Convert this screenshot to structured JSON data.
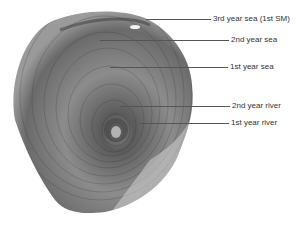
{
  "figure": {
    "labels": [
      {
        "text": "3rd year sea (1st SM)",
        "y": 19,
        "line_x1": 146,
        "line_x2": 211,
        "text_x": 213
      },
      {
        "text": "2nd year sea",
        "y": 40,
        "line_x1": 100,
        "line_x2": 229,
        "text_x": 231
      },
      {
        "text": "1st year sea",
        "y": 67,
        "line_x1": 110,
        "line_x2": 228,
        "text_x": 230
      },
      {
        "text": "2nd year river",
        "y": 106,
        "line_x1": 120,
        "line_x2": 230,
        "text_x": 232
      },
      {
        "text": "1st year river",
        "y": 123,
        "line_x1": 140,
        "line_x2": 229,
        "text_x": 231
      }
    ]
  }
}
